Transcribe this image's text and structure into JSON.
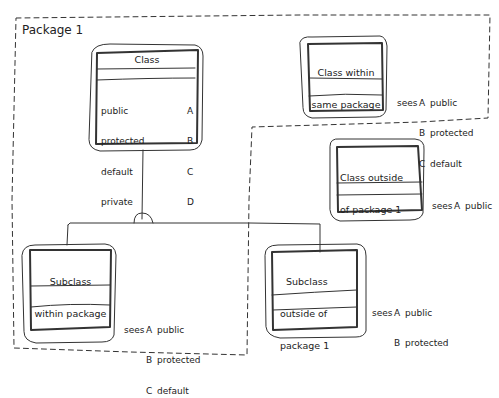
{
  "package": {
    "title": "Package 1"
  },
  "class": {
    "title": "Class",
    "members": [
      {
        "name": "public",
        "letter": "A"
      },
      {
        "name": "protected",
        "letter": "B"
      },
      {
        "name": "default",
        "letter": "C"
      },
      {
        "name": "private",
        "letter": "D"
      }
    ]
  },
  "same_package": {
    "title_line1": "Class within",
    "title_line2": "same package",
    "sees": {
      "prefix": "sees",
      "items": [
        {
          "letter": "A",
          "name": "public"
        },
        {
          "letter": "B",
          "name": "protected"
        },
        {
          "letter": "C",
          "name": "default"
        }
      ]
    }
  },
  "outside_package": {
    "title_line1": "Class outside",
    "title_line2": "of package 1",
    "sees": {
      "prefix": "sees",
      "items": [
        {
          "letter": "A",
          "name": "public"
        }
      ]
    }
  },
  "subclass_within": {
    "title_line1": "Subclass",
    "title_line2": "within package",
    "sees": {
      "prefix": "sees",
      "items": [
        {
          "letter": "A",
          "name": "public"
        },
        {
          "letter": "B",
          "name": "protected"
        },
        {
          "letter": "C",
          "name": "default"
        }
      ]
    }
  },
  "subclass_outside": {
    "title_line1": "Subclass",
    "title_line2": "outside of",
    "title_line3": "package 1",
    "sees": {
      "prefix": "sees",
      "items": [
        {
          "letter": "A",
          "name": "public"
        },
        {
          "letter": "B",
          "name": "protected"
        }
      ]
    }
  }
}
